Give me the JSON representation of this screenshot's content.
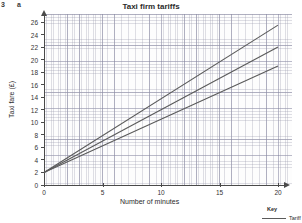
{
  "question": {
    "number": "3",
    "part": "a"
  },
  "chart_data": {
    "type": "line",
    "title": "Taxi firm tariffs",
    "xlabel": "Number of minutes",
    "ylabel": "Taxi fare (£)",
    "xlim": [
      0,
      20
    ],
    "ylim": [
      0,
      26
    ],
    "xticks": [
      0,
      5,
      10,
      15,
      20
    ],
    "yticks": [
      0,
      2,
      4,
      6,
      8,
      10,
      12,
      14,
      16,
      18,
      20,
      22,
      24,
      26
    ],
    "grid": true,
    "legend_position": "bottom-right",
    "legend_title": "Key",
    "series": [
      {
        "name": "Tariff 1",
        "color": "#5a5a5a",
        "intercept": 2.0,
        "slope": 1.175,
        "x": [
          0,
          20
        ],
        "values": [
          2.0,
          25.5
        ]
      },
      {
        "name": "Tariff 2",
        "color": "#5a5a5a",
        "intercept": 2.0,
        "slope": 1.0,
        "x": [
          0,
          20
        ],
        "values": [
          2.0,
          22.0
        ]
      },
      {
        "name": "Tariff 3",
        "color": "#5a5a5a",
        "intercept": 2.0,
        "slope": 0.85,
        "x": [
          0,
          20
        ],
        "values": [
          2.0,
          19.0
        ]
      }
    ]
  },
  "legend": {
    "title": "Key",
    "entries": [
      {
        "label": "Tariff 1"
      }
    ]
  },
  "colors": {
    "axis": "#4a4a4a",
    "grid": "#9696aa",
    "line": "#5a5a5a",
    "text": "#231f20"
  }
}
